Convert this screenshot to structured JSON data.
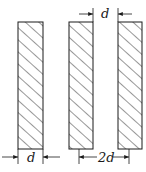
{
  "diagram": {
    "slabs": [
      {
        "id": "slab-1",
        "x": 18,
        "y": 22,
        "width": 25,
        "height": 127
      },
      {
        "id": "slab-2",
        "x": 69,
        "y": 22,
        "width": 24,
        "height": 127
      },
      {
        "id": "slab-3",
        "x": 118,
        "y": 22,
        "width": 24,
        "height": 127
      }
    ],
    "dimensions": {
      "slab_width_label": "d",
      "gap_label": "d",
      "pitch_label": "2d"
    },
    "colors": {
      "stroke": "#1a1a1a",
      "background": "#ffffff"
    }
  }
}
